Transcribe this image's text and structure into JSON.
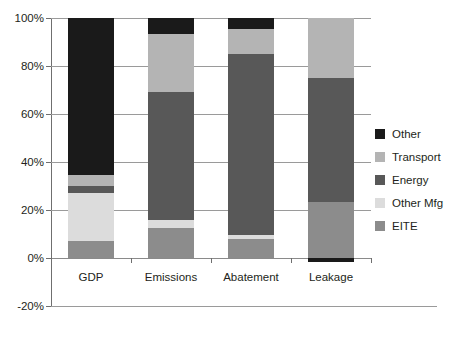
{
  "chart_data": {
    "type": "bar",
    "title": "",
    "subtitle": "",
    "xlabel": "",
    "ylabel": "",
    "stacked": true,
    "grid": true,
    "legend_position": "right",
    "categories": [
      "GDP",
      "Emissions",
      "Abatement",
      "Leakage"
    ],
    "ylim": [
      -20,
      100
    ],
    "yticks": [
      -20,
      0,
      20,
      40,
      60,
      80,
      100
    ],
    "ytick_labels": [
      "-20%",
      "0%",
      "20%",
      "40%",
      "60%",
      "80%",
      "100%"
    ],
    "series": [
      {
        "name": "EITE",
        "color": "#8c8c8c",
        "values": [
          7.0,
          12.5,
          8.0,
          23.5
        ]
      },
      {
        "name": "Other Mfg",
        "color": "#dcdcdc",
        "values": [
          20.0,
          3.5,
          1.5,
          0.0
        ]
      },
      {
        "name": "Energy",
        "color": "#585858",
        "values": [
          3.0,
          53.0,
          75.5,
          51.5
        ]
      },
      {
        "name": "Transport",
        "color": "#b4b4b4",
        "values": [
          4.5,
          24.5,
          10.5,
          25.0
        ]
      },
      {
        "name": "Other",
        "color": "#1a1a1a",
        "values": [
          65.5,
          6.5,
          4.5,
          -1.5
        ]
      }
    ]
  },
  "legend": {
    "items": [
      {
        "label": "Other",
        "color": "#1a1a1a"
      },
      {
        "label": "Transport",
        "color": "#b4b4b4"
      },
      {
        "label": "Energy",
        "color": "#585858"
      },
      {
        "label": "Other Mfg",
        "color": "#dcdcdc"
      },
      {
        "label": "EITE",
        "color": "#8c8c8c"
      }
    ]
  },
  "colors": {
    "grid": "#9a9a9a",
    "axis": "#6f6f6f",
    "text": "#231f20",
    "background": "#ffffff"
  }
}
